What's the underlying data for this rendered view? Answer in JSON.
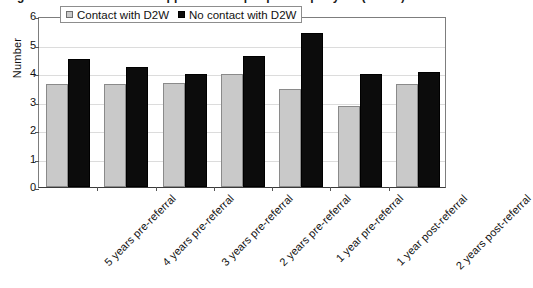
{
  "figure": {
    "title_clipped_fragment": "Figure 3: Mean number of appointments per patient per year (n = 58)"
  },
  "legend": {
    "position": "top-center-inside",
    "entries": [
      {
        "label": "Contact with D2W",
        "color": "#c9c9c9"
      },
      {
        "label": "No contact with D2W",
        "color": "#0c0c0c"
      }
    ]
  },
  "axes": {
    "ylabel": "Number",
    "yticks": [
      "6",
      "5",
      "4",
      "3",
      "2",
      "1",
      "0"
    ]
  },
  "chart_data": {
    "type": "bar",
    "title": "",
    "xlabel": "",
    "ylabel": "Number",
    "ylim": [
      0,
      6
    ],
    "ytick_values": [
      0,
      1,
      2,
      3,
      4,
      5,
      6
    ],
    "grid": true,
    "legend_position": "top-center-inside",
    "categories": [
      "5 years pre-referral",
      "4 years pre-referral",
      "3 years pre-referral",
      "2 years pre-referral",
      "1 year pre-referral",
      "1 year post-referral",
      "2 years post-referral"
    ],
    "series": [
      {
        "name": "Contact with D2W",
        "color": "#c9c9c9",
        "values": [
          3.6,
          3.6,
          3.65,
          3.95,
          3.45,
          2.85,
          3.6
        ]
      },
      {
        "name": "No contact with D2W",
        "color": "#0c0c0c",
        "values": [
          4.5,
          4.2,
          3.95,
          4.6,
          5.4,
          3.95,
          4.05
        ]
      }
    ]
  }
}
